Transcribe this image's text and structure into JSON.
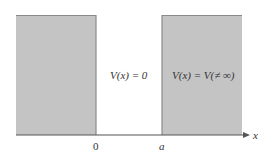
{
  "diagram": {
    "type": "potential-well",
    "colors": {
      "barrier_fill": "#c4c4c4",
      "barrier_edge": "#8a8a8a",
      "axis": "#555555",
      "text": "#333333"
    },
    "regions": [
      {
        "name": "left-barrier",
        "x_from": 16,
        "x_to": 96,
        "shaded": true
      },
      {
        "name": "well",
        "x_from": 96,
        "x_to": 162,
        "shaded": false,
        "label": "V(x) = 0"
      },
      {
        "name": "right-barrier",
        "x_from": 162,
        "x_to": 242,
        "shaded": true,
        "label": "V(x) = V(≠ ∞)"
      }
    ],
    "axis": {
      "label": "x",
      "ticks": [
        {
          "label": "0"
        },
        {
          "label": "a"
        }
      ]
    },
    "labels": {
      "well": "V(x) = 0",
      "barrier": "V(x) = V(≠ ∞)",
      "axis_x": "x",
      "tick_0": "0",
      "tick_a": "a"
    }
  }
}
